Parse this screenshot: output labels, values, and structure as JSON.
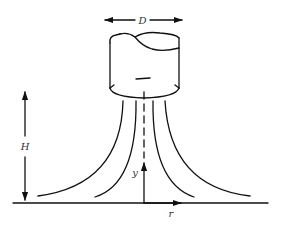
{
  "diagram": {
    "labels": {
      "diameter": "D",
      "height": "H",
      "axial": "y",
      "radial": "r"
    },
    "components": [
      {
        "name": "nozzle",
        "description": "cylindrical nozzle with broken (cut) top"
      },
      {
        "name": "centerline",
        "description": "dashed vertical symmetry axis"
      },
      {
        "name": "streamlines",
        "count": 4,
        "description": "jet streamlines spreading radially along the wall"
      },
      {
        "name": "ground",
        "description": "flat impingement surface"
      },
      {
        "name": "diameter-dimension",
        "description": "double-headed arrow above nozzle labeled D"
      },
      {
        "name": "height-dimension",
        "description": "double-headed vertical arrow labeled H"
      },
      {
        "name": "coordinate-axes",
        "description": "y axis up, r axis along wall"
      }
    ],
    "colors": {
      "stroke": "#111111",
      "label": "#333333",
      "background": "#ffffff"
    }
  }
}
